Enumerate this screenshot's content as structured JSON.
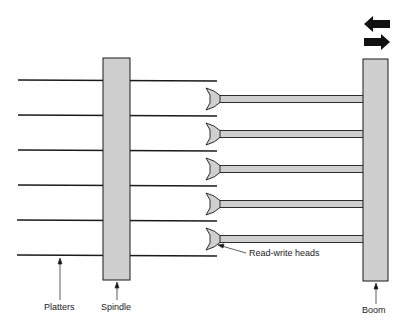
{
  "diagram": {
    "type": "disk-drive-schematic",
    "labels": {
      "platters": "Platters",
      "spindle": "Spindle",
      "heads": "Read-write heads",
      "boom": "Boom"
    },
    "colors": {
      "component_fill": "#cfcfcf",
      "stroke": "#1a1a1a",
      "arrow": "#111111"
    },
    "platter_count": 6,
    "head_count": 5,
    "motion_arrows": [
      "left",
      "right"
    ]
  }
}
